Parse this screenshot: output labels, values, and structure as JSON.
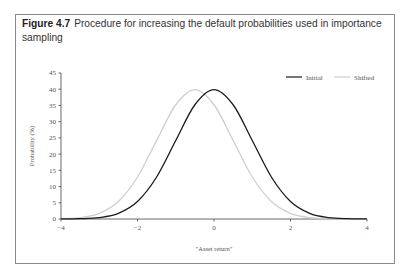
{
  "figure": {
    "number": "Figure 4.7",
    "caption": "Procedure for increasing the default probabilities used in importance sampling"
  },
  "colors": {
    "initial": "#1a1a1a",
    "shifted": "#cfcfcf",
    "axis": "#444444",
    "frame": "#8a8a8a"
  },
  "chart_data": {
    "type": "line",
    "title": "Procedure for increasing the default probabilities used in importance sampling",
    "xlabel": "\"Asset return\"",
    "ylabel": "Probability (%)",
    "xlim": [
      -4,
      4
    ],
    "ylim": [
      0,
      45
    ],
    "x_ticks": [
      -4,
      -2,
      0,
      2,
      4
    ],
    "y_ticks": [
      0,
      5,
      10,
      15,
      20,
      25,
      30,
      35,
      40,
      45
    ],
    "grid": false,
    "legend_position": "top-right",
    "x": [
      -4,
      -3.5,
      -3,
      -2.5,
      -2,
      -1.5,
      -1,
      -0.5,
      0,
      0.5,
      1,
      1.5,
      2,
      2.5,
      3,
      3.5,
      4
    ],
    "series": [
      {
        "name": "Initial",
        "values": [
          0.01,
          0.09,
          0.44,
          1.75,
          5.4,
          12.95,
          24.2,
          35.21,
          39.89,
          35.21,
          24.2,
          12.95,
          5.4,
          1.75,
          0.44,
          0.09,
          0.01
        ]
      },
      {
        "name": "Shifted",
        "values": [
          0.09,
          0.44,
          1.75,
          5.4,
          12.95,
          24.2,
          35.21,
          39.89,
          35.21,
          24.2,
          12.95,
          5.4,
          1.75,
          0.44,
          0.09,
          0.01,
          0.0
        ]
      }
    ]
  }
}
